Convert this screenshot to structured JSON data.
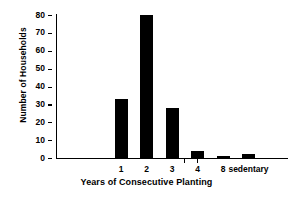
{
  "chart_data": {
    "type": "bar",
    "title": "",
    "xlabel": "Years of Consecutive Planting",
    "ylabel": "Number of Households",
    "categories": [
      "1",
      "2",
      "3",
      "4",
      "8",
      "sedentary"
    ],
    "values": [
      33,
      80,
      28,
      4,
      1,
      2
    ],
    "ylim": [
      0,
      80
    ],
    "yticks": [
      0,
      10,
      20,
      30,
      40,
      50,
      60,
      70,
      80
    ],
    "ytick_labels": [
      "0",
      "10",
      "20",
      "30",
      "40",
      "50",
      "60",
      "70",
      "80"
    ],
    "grid": false,
    "legend": false,
    "bar_color": "#000000",
    "background_color": "#ffffff",
    "axis_color": "#000000"
  }
}
